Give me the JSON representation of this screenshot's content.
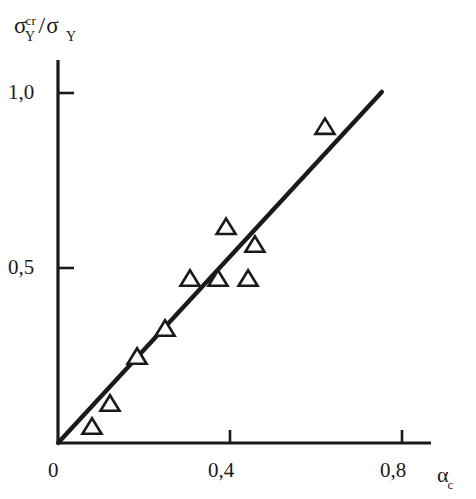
{
  "figure": {
    "background_color": "#ffffff",
    "ink_color": "#1a1a1a"
  },
  "axes": {
    "y_axis_label_main": "σ",
    "y_axis_label_superscript": "cr",
    "y_axis_label_subscript": "Y",
    "y_axis_label_separator": "/",
    "y_axis_label_denominator": "σ",
    "y_axis_label_denominator_subscript": "Y",
    "x_axis_label_main": "α",
    "x_axis_label_subscript": "c",
    "y_tick_labels": [
      "1,0",
      "0,5"
    ],
    "x_tick_labels": [
      "0",
      "0,4",
      "0,8"
    ]
  },
  "chart_data": {
    "type": "scatter",
    "title": "",
    "xlabel": "α_c",
    "ylabel": "σ_Y^cr / σ_Y",
    "xlim": [
      0,
      0.865
    ],
    "ylim": [
      0,
      1.095
    ],
    "xticks": [
      0,
      0.4,
      0.8
    ],
    "xticklabels": [
      "0",
      "0,4",
      "0,8"
    ],
    "yticks": [
      0.5,
      1.0
    ],
    "yticklabels": [
      "0,5",
      "1,0"
    ],
    "grid": false,
    "legend": "none",
    "marker": "open-triangle-up",
    "series": [
      {
        "name": "measured data",
        "marker": "triangle",
        "points": [
          {
            "x": 0.079,
            "y": 0.043
          },
          {
            "x": 0.121,
            "y": 0.109
          },
          {
            "x": 0.184,
            "y": 0.243
          },
          {
            "x": 0.249,
            "y": 0.323
          },
          {
            "x": 0.307,
            "y": 0.466
          },
          {
            "x": 0.372,
            "y": 0.466
          },
          {
            "x": 0.391,
            "y": 0.614
          },
          {
            "x": 0.442,
            "y": 0.466
          },
          {
            "x": 0.458,
            "y": 0.563
          },
          {
            "x": 0.621,
            "y": 0.9
          }
        ]
      }
    ],
    "fit_line": {
      "name": "linear fit through origin",
      "x_start": 0.0,
      "y_start": 0.0,
      "x_end": 0.753,
      "y_end": 1.003,
      "slope": 1.332
    }
  }
}
